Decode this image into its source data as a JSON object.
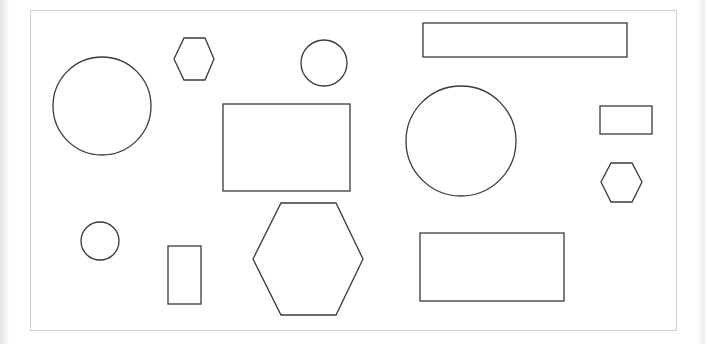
{
  "canvas": {
    "width": 707,
    "height": 344,
    "background": "#ffffff",
    "frame": {
      "x": 30.5,
      "y": 10.5,
      "width": 646,
      "height": 320,
      "stroke": "#cfcfcf",
      "stroke_width": 1
    }
  },
  "style": {
    "shape_stroke": "#3a3a3a",
    "shape_stroke_width": 1.3,
    "shape_fill": "none"
  },
  "shapes": {
    "circles": [
      {
        "id": "circle-large-left",
        "cx": 102,
        "cy": 106,
        "r": 49
      },
      {
        "id": "circle-small-top",
        "cx": 324,
        "cy": 63,
        "r": 23
      },
      {
        "id": "circle-large-center",
        "cx": 461,
        "cy": 141,
        "r": 55
      },
      {
        "id": "circle-small-bottom-left",
        "cx": 100,
        "cy": 241,
        "r": 19
      }
    ],
    "rectangles": [
      {
        "id": "rect-wide-top",
        "x": 423,
        "y": 23,
        "width": 204,
        "height": 34
      },
      {
        "id": "rect-center",
        "x": 223,
        "y": 104,
        "width": 127,
        "height": 87
      },
      {
        "id": "rect-small-right",
        "x": 600,
        "y": 106,
        "width": 52,
        "height": 28
      },
      {
        "id": "rect-tall-bottom",
        "x": 168,
        "y": 246,
        "width": 33,
        "height": 58
      },
      {
        "id": "rect-bottom-right",
        "x": 420,
        "y": 233,
        "width": 144,
        "height": 68
      }
    ],
    "hexagons": [
      {
        "id": "hexagon-small-top",
        "points": "184,38 205,38 214,59 205,80 184,80 174,59"
      },
      {
        "id": "hexagon-small-right",
        "points": "611,163 632,163 642,182 632,202 611,202 601,182"
      },
      {
        "id": "hexagon-large-bottom",
        "points": "281,203 336,203 363,259 336,315 281,315 253,259"
      }
    ]
  }
}
